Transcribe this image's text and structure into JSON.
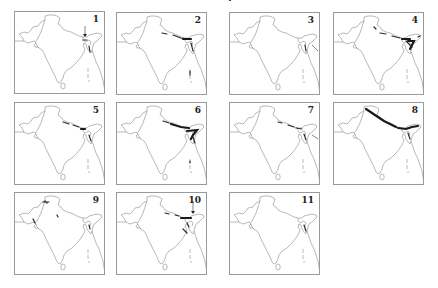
{
  "figure": {
    "top_fragment": "·",
    "panel_count": 11,
    "panels": [
      {
        "number": "1",
        "x": 14,
        "y": 11,
        "distribution": "arrow-marked single locality in eastern Himalaya / Sikkim area"
      },
      {
        "number": "2",
        "x": 116,
        "y": 12,
        "distribution": "central-eastern Himalaya band and northeast"
      },
      {
        "number": "3",
        "x": 229,
        "y": 12,
        "distribution": "northeast hills, sparse"
      },
      {
        "number": "4",
        "x": 333,
        "y": 12,
        "distribution": "western to eastern Himalaya and dense northeast"
      },
      {
        "number": "5",
        "x": 14,
        "y": 102,
        "distribution": "central Himalaya band and northeast"
      },
      {
        "number": "6",
        "x": 116,
        "y": 102,
        "distribution": "dense central-eastern Himalaya and northeast"
      },
      {
        "number": "7",
        "x": 229,
        "y": 102,
        "distribution": "Himalaya band sparse and northeast"
      },
      {
        "number": "8",
        "x": 333,
        "y": 102,
        "distribution": "full Himalayan arc from Kashmir to Arunachal"
      },
      {
        "number": "9",
        "x": 14,
        "y": 192,
        "distribution": "Kashmir, Gujarat coast and scattered localities"
      },
      {
        "number": "10",
        "x": 116,
        "y": 192,
        "distribution": "eastern Himalaya with arrow-marked locality and northeast"
      },
      {
        "number": "11",
        "x": 229,
        "y": 192,
        "distribution": "northeast, sparse"
      }
    ]
  },
  "colors": {
    "outline": "#8a8a8a",
    "border": "#9a9a9a",
    "distribution": "#1a1a1a",
    "background": "#ffffff"
  }
}
